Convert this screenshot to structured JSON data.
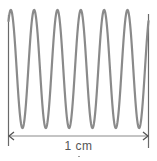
{
  "diagram": {
    "wave": {
      "cycles": 6,
      "color": "#8a8a8a",
      "stroke_width": 2.2,
      "x_start": 8.5,
      "x_end": 148.5,
      "y_center": 69,
      "amplitude": 59,
      "phase_start": "rising from mid-height at left boundary"
    },
    "boundaries": {
      "left": {
        "x": 8.5,
        "y_top": 15,
        "y_bottom": 146
      },
      "right": {
        "x": 148.5,
        "y_top": 14,
        "y_bottom": 148
      },
      "color": "#6a6a6a"
    },
    "dimension": {
      "y": 136,
      "x_start": 9,
      "x_end": 148,
      "color": "#8a8a8a",
      "label": "1 cm"
    }
  }
}
